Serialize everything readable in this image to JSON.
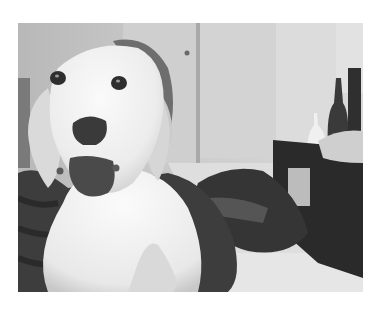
{
  "image": {
    "description": "Grayscale photo of a white Labrador-type dog with mouth open, held by a person in a dark hoodie, in a room with a door, dark dresser with bottles, and clothes piled on the floor",
    "subject": "dog",
    "colors": {
      "background": "#ffffff",
      "wall": "#c4c4c4",
      "wall_light": "#d6d6d6",
      "door": "#cfcfcf",
      "floor": "#dedede",
      "dog_fur": "#f2f2f2",
      "dog_shadow": "#d4d4d4",
      "nose": "#3a3a3a",
      "mouth": "#4a4a4a",
      "person_clothing": "#3d3d3d",
      "dresser": "#2a2a2a",
      "clothes_pile": "#333333"
    },
    "frame": {
      "x": 18,
      "y": 23,
      "width": 345,
      "height": 269
    }
  }
}
